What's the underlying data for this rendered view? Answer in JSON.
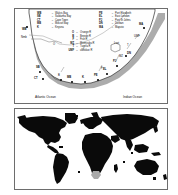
{
  "top_panel": {
    "legend_localities": [
      {
        "code": "WB",
        "dash": "–",
        "name": "Walvis Bay"
      },
      {
        "code": "PE",
        "dash": "–",
        "name": "Port Elizabeth"
      },
      {
        "code": "SB",
        "dash": "–",
        "name": "Saldanha Bay"
      },
      {
        "code": "EL",
        "dash": "–",
        "name": "East London"
      },
      {
        "code": "CT",
        "dash": "–",
        "name": "Cape Town"
      },
      {
        "code": "PJ",
        "dash": "–",
        "name": "Port St Johns"
      },
      {
        "code": "MB",
        "dash": "–",
        "name": "Mossel Bay"
      },
      {
        "code": "DN",
        "dash": "–",
        "name": "Durban"
      },
      {
        "code": "K",
        "dash": "–",
        "name": "Knysna"
      },
      {
        "code": "MA",
        "dash": "–",
        "name": "Maputo"
      }
    ],
    "legend_rivers": [
      {
        "code": "O",
        "dash": "–",
        "name": "Orange R"
      },
      {
        "code": "B",
        "dash": "–",
        "name": "Breede R"
      },
      {
        "code": "F",
        "dash": "–",
        "name": "Fish R"
      },
      {
        "code": "MZ",
        "dash": "–",
        "name": "Mzimvubu R"
      },
      {
        "code": "T",
        "dash": "–",
        "name": "Tugela R"
      },
      {
        "code": "UMF",
        "dash": "–",
        "name": "uMfolozi R"
      }
    ],
    "map_labels": [
      {
        "id": "namibia",
        "text": "Nmb"
      },
      {
        "id": "orange-river",
        "text": "O"
      },
      {
        "id": "lesotho",
        "text": "Lsot"
      },
      {
        "id": "saldanha-bay",
        "text": "SB"
      },
      {
        "id": "cape-town",
        "text": "CT"
      },
      {
        "id": "breede-river",
        "text": "B"
      },
      {
        "id": "mossel-bay",
        "text": "MB"
      },
      {
        "id": "knysna",
        "text": "K"
      },
      {
        "id": "port-elizabeth",
        "text": "PE"
      },
      {
        "id": "fish-river",
        "text": "F"
      },
      {
        "id": "east-london",
        "text": "EL"
      },
      {
        "id": "port-st-johns",
        "text": "PJ"
      },
      {
        "id": "mzimvubu-river",
        "text": "MZ"
      },
      {
        "id": "durban",
        "text": "DN"
      },
      {
        "id": "tugela-river",
        "text": "T"
      },
      {
        "id": "umfolozi-river",
        "text": "UMF"
      },
      {
        "id": "maputo",
        "text": "MA"
      },
      {
        "id": "walvis-bay",
        "text": "WB"
      }
    ],
    "ocean_labels": {
      "atlantic": "Atlantic Ocean",
      "indian": "Indian Ocean"
    }
  },
  "bottom_panel": {
    "description": "World map inset, continents in black, study region highlighted in grey"
  },
  "colors": {
    "land_fill": "#ffffff",
    "land_stroke": "#2b2b2b",
    "shelf_fill": "#9b9b9b",
    "world_land": "#0a0a0a",
    "world_highlight": "#a9a9a9",
    "panel_border": "#6d6d6d",
    "text": "#101010"
  }
}
